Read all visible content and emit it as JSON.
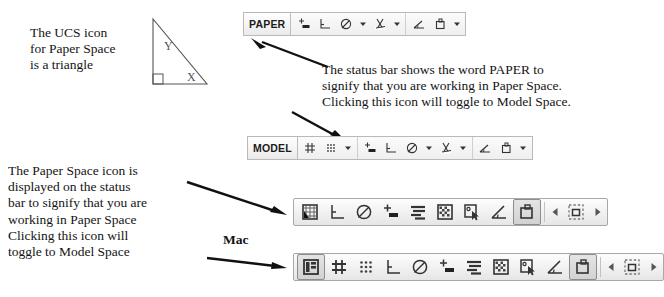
{
  "notes": {
    "ucs": [
      "The UCS icon",
      "for Paper Space",
      "is a triangle"
    ],
    "paper_status": [
      "The status bar shows the word PAPER to",
      "signify that you are working in Paper Space.",
      "Clicking this icon will toggle to Model Space."
    ],
    "paper_icon": [
      "The Paper Space icon is",
      "displayed on the status",
      "bar to signify that you are",
      "working in Paper Space",
      "Clicking this icon will",
      "toggle to Model Space"
    ],
    "mac_label": "Mac"
  },
  "ucs_icon": {
    "x_label": "X",
    "y_label": "Y"
  },
  "paper_toolbar": {
    "mode_label": "PAPER",
    "buttons": [
      {
        "name": "snap-mode-icon",
        "type": "snap"
      },
      {
        "name": "ortho-mode-icon",
        "type": "ortho"
      },
      {
        "name": "polar-tracking-icon",
        "type": "polar"
      },
      {
        "name": "polar-dropdown-icon",
        "type": "caret"
      },
      {
        "name": "object-snap-icon",
        "type": "osnap"
      },
      {
        "name": "object-snap-dropdown-icon",
        "type": "caret"
      },
      {
        "name": "object-snap-tracking-icon",
        "type": "otrack"
      },
      {
        "name": "ucs-icon",
        "type": "ucs"
      },
      {
        "name": "ucs-dropdown-icon",
        "type": "caret"
      }
    ]
  },
  "model_toolbar": {
    "mode_label": "MODEL",
    "buttons": [
      {
        "name": "grid-display-icon",
        "type": "grid"
      },
      {
        "name": "snap-grid-dots-icon",
        "type": "dots"
      },
      {
        "name": "snap-dropdown-icon",
        "type": "caret"
      },
      {
        "name": "snap-mode-icon",
        "type": "snap"
      },
      {
        "name": "ortho-mode-icon",
        "type": "ortho"
      },
      {
        "name": "polar-tracking-icon",
        "type": "polar"
      },
      {
        "name": "polar-dropdown-icon",
        "type": "caret"
      },
      {
        "name": "object-snap-icon",
        "type": "osnap"
      },
      {
        "name": "object-snap-dropdown-icon",
        "type": "caret"
      },
      {
        "name": "object-snap-tracking-icon",
        "type": "otrack"
      },
      {
        "name": "ucs-icon",
        "type": "ucs"
      },
      {
        "name": "ucs-dropdown-icon",
        "type": "caret"
      }
    ]
  },
  "mac_toolbar_paper": {
    "buttons": [
      {
        "name": "grid-snap-cursor-icon",
        "type": "gridcursor",
        "selected": false
      },
      {
        "name": "ortho-mode-icon",
        "type": "ortho",
        "selected": false
      },
      {
        "name": "polar-tracking-icon",
        "type": "polar",
        "selected": false
      },
      {
        "name": "snap-mode-icon",
        "type": "snap",
        "selected": false
      },
      {
        "name": "dynamic-input-icon",
        "type": "lines",
        "selected": false
      },
      {
        "name": "object-snap-icon",
        "type": "checker",
        "selected": false
      },
      {
        "name": "object-snap-tracking-icon",
        "type": "osnaptrack",
        "selected": false
      },
      {
        "name": "ucs-angle-icon",
        "type": "ucs",
        "selected": false
      },
      {
        "name": "paper-space-icon",
        "type": "paperspace",
        "selected": true
      },
      {
        "name": "scroll-left-icon",
        "type": "arrowleft",
        "selected": false
      },
      {
        "name": "viewport-select-icon",
        "type": "viewport",
        "selected": false
      },
      {
        "name": "scroll-right-icon",
        "type": "arrowright",
        "selected": false
      }
    ]
  },
  "mac_toolbar_model": {
    "buttons": [
      {
        "name": "layout-space-icon",
        "type": "layout",
        "selected": true
      },
      {
        "name": "grid-display-icon",
        "type": "grid",
        "selected": false
      },
      {
        "name": "snap-grid-dots-icon",
        "type": "dots",
        "selected": false
      },
      {
        "name": "ortho-mode-icon",
        "type": "ortho",
        "selected": false
      },
      {
        "name": "polar-tracking-icon",
        "type": "polar",
        "selected": false
      },
      {
        "name": "snap-mode-icon",
        "type": "snap",
        "selected": false
      },
      {
        "name": "dynamic-input-icon",
        "type": "lines",
        "selected": false
      },
      {
        "name": "object-snap-icon",
        "type": "checker",
        "selected": false
      },
      {
        "name": "object-snap-tracking-icon",
        "type": "osnaptrack",
        "selected": false
      },
      {
        "name": "ucs-angle-icon",
        "type": "ucs",
        "selected": false
      },
      {
        "name": "paper-space-icon",
        "type": "paperspace",
        "selected": true
      },
      {
        "name": "scroll-left-icon",
        "type": "arrowleft",
        "selected": false
      },
      {
        "name": "viewport-select-icon",
        "type": "viewport",
        "selected": false
      },
      {
        "name": "scroll-right-icon",
        "type": "arrowright",
        "selected": false
      }
    ]
  },
  "colors": {
    "ink": "#141414",
    "toolbar_border": "#b9b9b9",
    "icon": "#333333"
  }
}
